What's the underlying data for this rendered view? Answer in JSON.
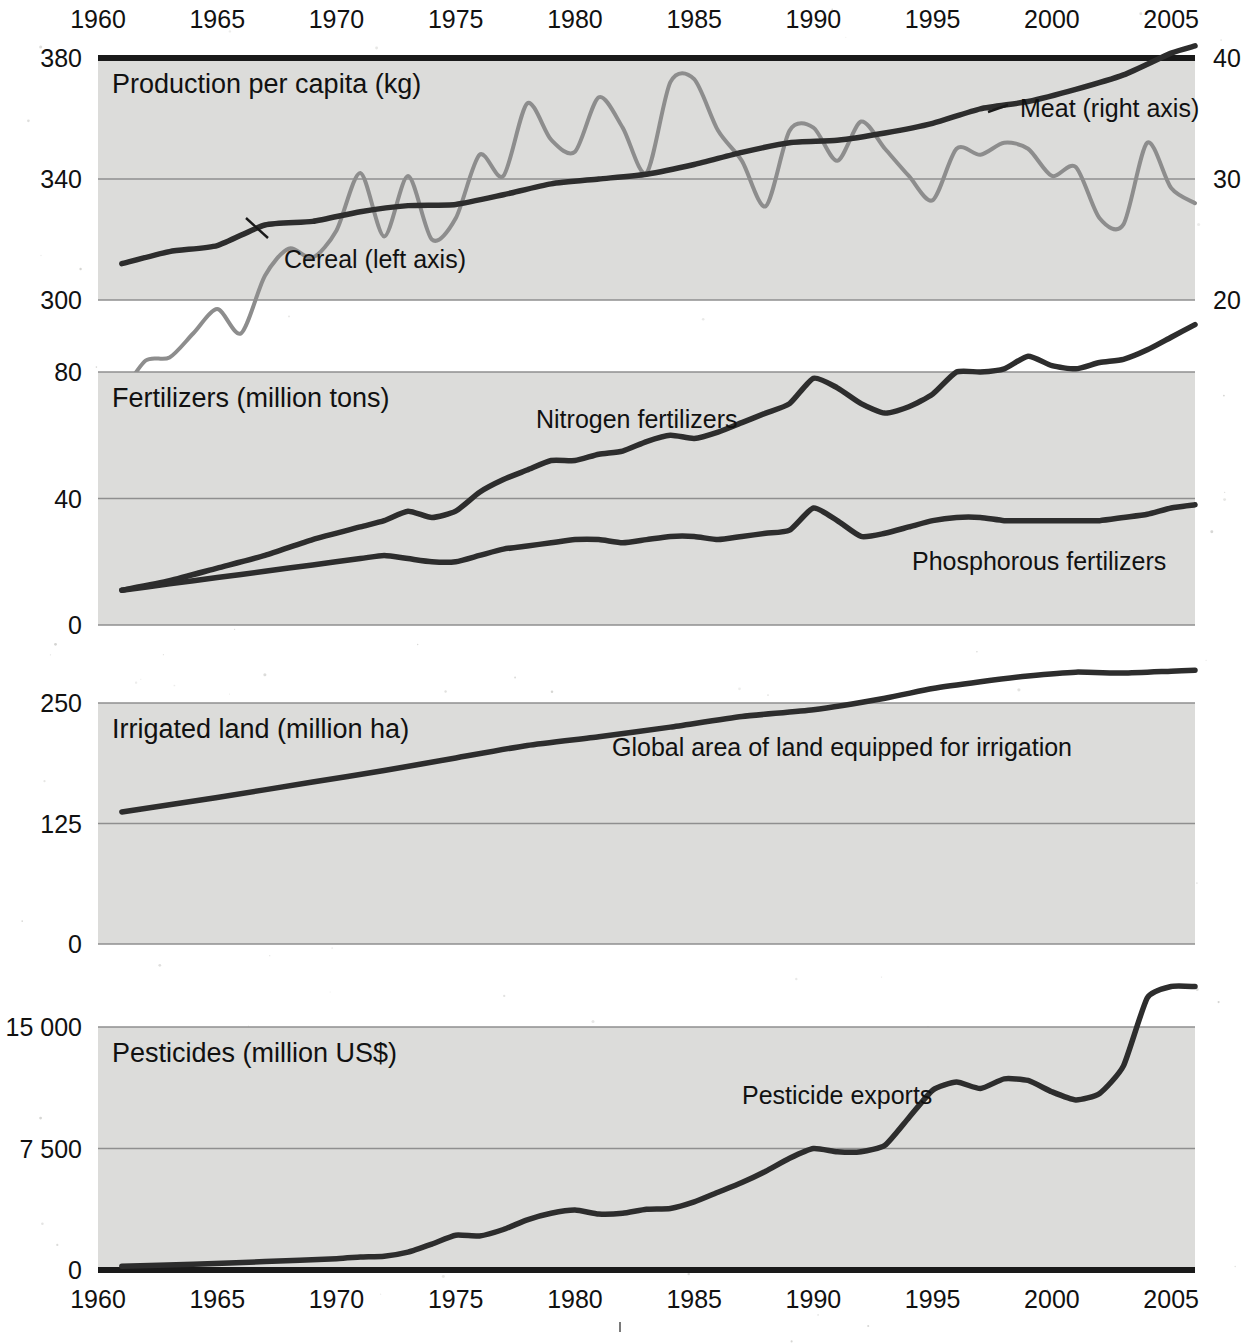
{
  "figure": {
    "background_color": "#ffffff",
    "plot_background_color": "#dcdcda",
    "dark_series_color": "#2d2d2d",
    "light_series_color": "#8d8d8d"
  },
  "axis": {
    "x_top_ticks": [
      "1960",
      "1965",
      "1970",
      "1975",
      "1980",
      "1985",
      "1990",
      "1995",
      "2000",
      "2005"
    ],
    "x_bottom_ticks": [
      "1960",
      "1965",
      "1970",
      "1975",
      "1980",
      "1985",
      "1990",
      "1995",
      "2000",
      "2005"
    ],
    "x_range": [
      1960,
      2006
    ]
  },
  "chart_data": [
    {
      "type": "line",
      "title": "Production per capita (kg)",
      "panel": 1,
      "xlabel": "",
      "ylabel": "Production per capita (kg)",
      "ylim": [
        300,
        380
      ],
      "yticks": [
        "300",
        "340",
        "380"
      ],
      "y2lim": [
        20,
        40
      ],
      "y2ticks": [
        "20",
        "30",
        "40"
      ],
      "grid": true,
      "legend_position": "inline-annotation",
      "series": [
        {
          "name": "Cereal (left axis)",
          "axis": "left",
          "color": "#8d8d8d",
          "x": [
            1961,
            1962,
            1963,
            1964,
            1965,
            1966,
            1967,
            1968,
            1969,
            1970,
            1971,
            1972,
            1973,
            1974,
            1975,
            1976,
            1977,
            1978,
            1979,
            1980,
            1981,
            1982,
            1983,
            1984,
            1985,
            1986,
            1987,
            1988,
            1989,
            1990,
            1991,
            1992,
            1993,
            1994,
            1995,
            1996,
            1997,
            1998,
            1999,
            2000,
            2001,
            2002,
            2003,
            2004,
            2005,
            2006
          ],
          "values": [
            269,
            280,
            281,
            289,
            297,
            289,
            308,
            317,
            314,
            323,
            342,
            321,
            341,
            320,
            327,
            348,
            341,
            365,
            353,
            349,
            367,
            357,
            342,
            372,
            373,
            356,
            346,
            331,
            356,
            357,
            346,
            359,
            350,
            341,
            333,
            350,
            348,
            352,
            350,
            341,
            344,
            327,
            325,
            352,
            337,
            332
          ]
        },
        {
          "name": "Meat (right axis)",
          "axis": "right",
          "color": "#2d2d2d",
          "x": [
            1961,
            1963,
            1965,
            1967,
            1969,
            1971,
            1973,
            1975,
            1977,
            1979,
            1981,
            1983,
            1985,
            1987,
            1989,
            1991,
            1993,
            1995,
            1997,
            1999,
            2001,
            2003,
            2005,
            2006
          ],
          "values": [
            23.0,
            24.0,
            24.5,
            26.2,
            26.5,
            27.3,
            27.8,
            27.9,
            28.7,
            29.6,
            30.0,
            30.4,
            31.2,
            32.2,
            33.0,
            33.2,
            33.8,
            34.6,
            35.8,
            36.4,
            37.4,
            38.6,
            40.4,
            41.0
          ]
        }
      ]
    },
    {
      "type": "line",
      "title": "Fertilizers (million tons)",
      "panel": 2,
      "xlabel": "",
      "ylabel": "Fertilizers (million tons)",
      "ylim": [
        0,
        80
      ],
      "yticks": [
        "0",
        "40",
        "80"
      ],
      "grid": true,
      "legend_position": "inline-annotation",
      "series": [
        {
          "name": "Nitrogen fertilizers",
          "color": "#2d2d2d",
          "x": [
            1961,
            1963,
            1965,
            1967,
            1969,
            1971,
            1972,
            1973,
            1974,
            1975,
            1976,
            1977,
            1978,
            1979,
            1980,
            1981,
            1982,
            1983,
            1984,
            1985,
            1986,
            1987,
            1988,
            1989,
            1990,
            1991,
            1992,
            1993,
            1994,
            1995,
            1996,
            1997,
            1998,
            1999,
            2000,
            2001,
            2002,
            2003,
            2004,
            2005,
            2006
          ],
          "values": [
            11,
            14,
            18,
            22,
            27,
            31,
            33,
            36,
            34,
            36,
            42,
            46,
            49,
            52,
            52,
            54,
            55,
            58,
            60,
            59,
            61,
            64,
            67,
            70,
            78,
            75,
            70,
            67,
            69,
            73,
            80,
            80,
            81,
            85,
            82,
            81,
            83,
            84,
            87,
            91,
            95
          ]
        },
        {
          "name": "Phosphorous fertilizers",
          "color": "#2d2d2d",
          "x": [
            1961,
            1963,
            1965,
            1967,
            1969,
            1971,
            1972,
            1973,
            1974,
            1975,
            1976,
            1977,
            1978,
            1979,
            1980,
            1981,
            1982,
            1983,
            1984,
            1985,
            1986,
            1987,
            1988,
            1989,
            1990,
            1991,
            1992,
            1993,
            1994,
            1995,
            1996,
            1997,
            1998,
            1999,
            2000,
            2001,
            2002,
            2003,
            2004,
            2005,
            2006
          ],
          "values": [
            11,
            13,
            15,
            17,
            19,
            21,
            22,
            21,
            20,
            20,
            22,
            24,
            25,
            26,
            27,
            27,
            26,
            27,
            28,
            28,
            27,
            28,
            29,
            30,
            37,
            33,
            28,
            29,
            31,
            33,
            34,
            34,
            33,
            33,
            33,
            33,
            33,
            34,
            35,
            37,
            38
          ]
        }
      ]
    },
    {
      "type": "line",
      "title": "Irrigated land (million ha)",
      "panel": 3,
      "xlabel": "",
      "ylabel": "Irrigated land (million ha)",
      "ylim": [
        0,
        250
      ],
      "yticks": [
        "0",
        "125",
        "250"
      ],
      "grid": true,
      "legend_position": "inline-annotation",
      "series": [
        {
          "name": "Global area of land equipped for irrigation",
          "color": "#2d2d2d",
          "x": [
            1961,
            1965,
            1969,
            1972,
            1975,
            1978,
            1981,
            1984,
            1987,
            1990,
            1993,
            1995,
            1997,
            1999,
            2001,
            2003,
            2005,
            2006
          ],
          "values": [
            137,
            152,
            168,
            180,
            193,
            206,
            215,
            225,
            236,
            243,
            255,
            265,
            272,
            278,
            282,
            281,
            283,
            284
          ]
        }
      ]
    },
    {
      "type": "line",
      "title": "Pesticides (million US$)",
      "panel": 4,
      "xlabel": "",
      "ylabel": "Pesticides (million US$)",
      "ylim": [
        0,
        15000
      ],
      "yticks": [
        "0",
        "7 500",
        "15 000"
      ],
      "grid": true,
      "legend_position": "inline-annotation",
      "series": [
        {
          "name": "Pesticide exports",
          "color": "#2d2d2d",
          "x": [
            1961,
            1964,
            1967,
            1970,
            1971,
            1972,
            1973,
            1974,
            1975,
            1976,
            1977,
            1978,
            1979,
            1980,
            1981,
            1982,
            1983,
            1984,
            1985,
            1986,
            1987,
            1988,
            1989,
            1990,
            1991,
            1992,
            1993,
            1994,
            1995,
            1996,
            1997,
            1998,
            1999,
            2000,
            2001,
            2002,
            2003,
            2004,
            2005,
            2006
          ],
          "values": [
            230,
            350,
            520,
            700,
            800,
            850,
            1100,
            1600,
            2150,
            2100,
            2500,
            3100,
            3500,
            3700,
            3450,
            3500,
            3750,
            3800,
            4200,
            4800,
            5400,
            6100,
            6900,
            7500,
            7300,
            7300,
            7700,
            9400,
            11100,
            11600,
            11200,
            11800,
            11700,
            11000,
            10500,
            10900,
            12600,
            16800,
            17500,
            17500
          ]
        }
      ]
    }
  ],
  "annotations": {
    "cereal_label": "Cereal (left axis)",
    "meat_label": "Meat (right axis)",
    "nitrogen_label": "Nitrogen fertilizers",
    "phosphorous_label": "Phosphorous fertilizers",
    "irrigation_label": "Global area of land equipped for irrigation",
    "pesticide_label": "Pesticide exports"
  }
}
